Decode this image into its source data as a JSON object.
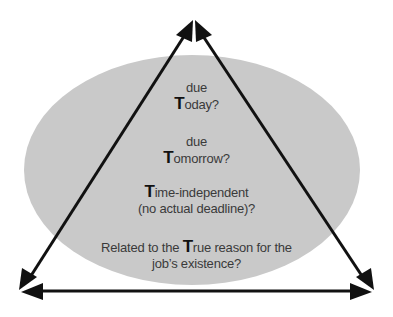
{
  "diagram": {
    "type": "triangle-over-ellipse",
    "colors": {
      "background": "#ffffff",
      "ellipse_fill": "#c9c9c9",
      "arrow": "#111111",
      "text": "#3a3a3a"
    },
    "vertices": {
      "top": "apex",
      "bottom_left": "left corner",
      "bottom_right": "right corner"
    },
    "arrows": [
      {
        "name": "left-edge",
        "from": "top",
        "to": "bottom_left",
        "double_headed": true
      },
      {
        "name": "right-edge",
        "from": "top",
        "to": "bottom_right",
        "double_headed": true
      },
      {
        "name": "base-edge",
        "from": "bottom_left",
        "to": "bottom_right",
        "double_headed": true
      }
    ]
  },
  "questions": [
    {
      "line1": "due",
      "line2_initial": "T",
      "line2_rest": "oday?"
    },
    {
      "line1": "due",
      "line2_initial": "T",
      "line2_rest": "omorrow?"
    },
    {
      "line1_initial": "T",
      "line1_rest": "ime-independent",
      "line2": "(no actual deadline)?"
    },
    {
      "line1_pre": "Related to the ",
      "line1_initial": "T",
      "line1_rest": "rue reason for the",
      "line2": "job’s existence?"
    }
  ]
}
